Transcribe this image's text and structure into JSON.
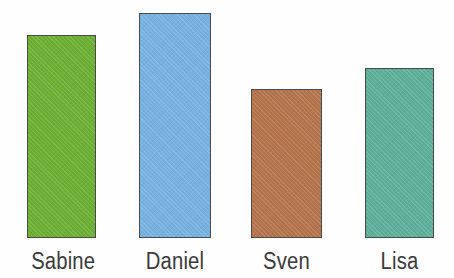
{
  "chart_data": {
    "type": "bar",
    "title": "",
    "subtitle": "",
    "xlabel": "",
    "ylabel": "",
    "categories": [
      "Sabine",
      "Daniel",
      "Sven",
      "Lisa"
    ],
    "values": [
      203,
      225,
      149,
      170
    ],
    "ylim": [
      0,
      238
    ],
    "grid": false,
    "legend": false,
    "axis_visible": false,
    "background_color": "#fefefe",
    "bar_outline_color": "#4a4a4a",
    "label_color": "#3a3a3a",
    "bars": [
      {
        "category": "Sabine",
        "value": 203,
        "color": "#6cb033",
        "color_name": "green",
        "x": 27,
        "width": 69,
        "top": 35,
        "height": 203
      },
      {
        "category": "Daniel",
        "value": 225,
        "color": "#76b1e0",
        "color_name": "light-blue",
        "x": 139,
        "width": 72,
        "top": 13,
        "height": 225
      },
      {
        "category": "Sven",
        "value": 149,
        "color": "#b5734c",
        "color_name": "sienna-brown",
        "x": 251,
        "width": 71,
        "top": 89,
        "height": 149
      },
      {
        "category": "Lisa",
        "value": 170,
        "color": "#5cb09a",
        "color_name": "teal",
        "x": 365,
        "width": 69,
        "top": 68,
        "height": 170
      }
    ]
  }
}
